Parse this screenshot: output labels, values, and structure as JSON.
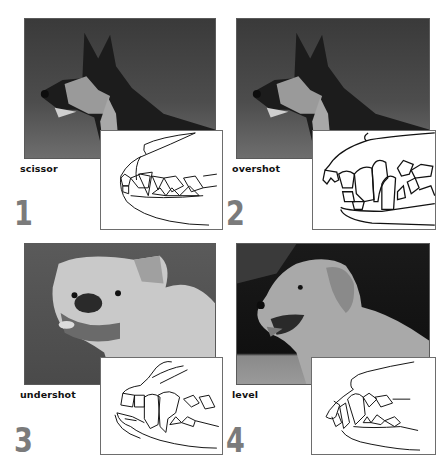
{
  "figure": {
    "panels": [
      {
        "number": "1",
        "label": "scissor",
        "photo_subject": "German Shepherd dog in profile, grayscale photo",
        "diagram_subject": "jaw line drawing showing scissor bite"
      },
      {
        "number": "2",
        "label": "overshot",
        "photo_subject": "German Shepherd dog in profile, grayscale photo",
        "diagram_subject": "jaw line drawing showing overshot bite"
      },
      {
        "number": "3",
        "label": "undershot",
        "photo_subject": "Bulldog, grayscale photo",
        "diagram_subject": "jaw line drawing showing undershot bite"
      },
      {
        "number": "4",
        "label": "level",
        "photo_subject": "Golden Retriever in profile, grayscale photo",
        "diagram_subject": "jaw line drawing showing level bite"
      }
    ],
    "colors": {
      "number_gray": "#7b7b7b",
      "label_black": "#111111",
      "border_gray": "#6d6d6d"
    }
  }
}
